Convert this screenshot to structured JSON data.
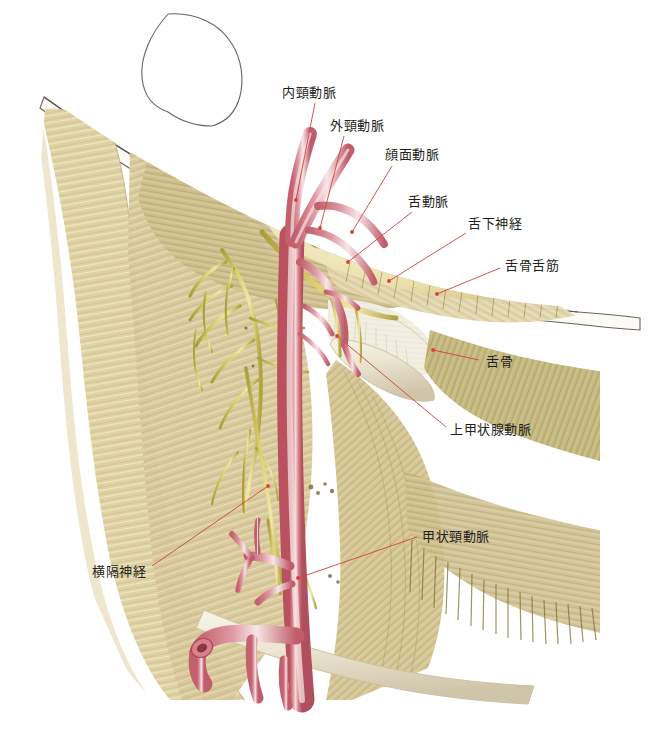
{
  "figure": {
    "background_color": "#ffffff",
    "width": 649,
    "height": 734,
    "leader_line_color": "#d4413c",
    "label_text_color": "#231f20"
  },
  "palette": {
    "artery": "#d9808c",
    "artery_shadow": "#b9515f",
    "artery_highlight": "#f6e0e0",
    "nerve": "#d8cc62",
    "nerve_shadow": "#a89a33",
    "muscle_light": "#ded0a2",
    "muscle_mid": "#c8b781",
    "muscle_dark": "#9a8b55",
    "muscle_olive": "#8d8347",
    "gland_fat": "#eee6b4",
    "fascia_white": "#f4f2e9",
    "bone": "#efeadb",
    "skin_outline": "#6b6257"
  },
  "labels": [
    {
      "id": "internal-carotid-artery",
      "text": "内頸動脈",
      "x": 282,
      "y": 93,
      "anchor": "start",
      "leader": [
        [
          315,
          103
        ],
        [
          296,
          200
        ]
      ]
    },
    {
      "id": "external-carotid-artery",
      "text": "外頸動脈",
      "x": 330,
      "y": 126,
      "anchor": "start",
      "leader": [
        [
          344,
          136
        ],
        [
          320,
          228
        ]
      ]
    },
    {
      "id": "facial-artery",
      "text": "顔面動脈",
      "x": 385,
      "y": 155,
      "anchor": "start",
      "leader": [
        [
          392,
          166
        ],
        [
          352,
          232
        ]
      ]
    },
    {
      "id": "lingual-artery",
      "text": "舌動脈",
      "x": 408,
      "y": 202,
      "anchor": "start",
      "leader": [
        [
          412,
          212
        ],
        [
          348,
          262
        ]
      ]
    },
    {
      "id": "hypoglossal-nerve",
      "text": "舌下神経",
      "x": 468,
      "y": 224,
      "anchor": "start",
      "leader": [
        [
          466,
          233
        ],
        [
          389,
          281
        ]
      ]
    },
    {
      "id": "hyoglossus-muscle",
      "text": "舌骨舌筋",
      "x": 505,
      "y": 266,
      "anchor": "start",
      "leader": [
        [
          500,
          268
        ],
        [
          437,
          294
        ]
      ]
    },
    {
      "id": "hyoid-bone",
      "text": "舌骨",
      "x": 486,
      "y": 362,
      "anchor": "start",
      "leader": [
        [
          479,
          360
        ],
        [
          433,
          350
        ]
      ]
    },
    {
      "id": "superior-thyroid-artery",
      "text": "上甲状腺動脈",
      "x": 450,
      "y": 430,
      "anchor": "start",
      "leader": [
        [
          446,
          427
        ],
        [
          337,
          336
        ]
      ]
    },
    {
      "id": "thyrocervical-trunk",
      "text": "甲状頸動脈",
      "x": 422,
      "y": 537,
      "anchor": "start",
      "leader": [
        [
          417,
          537
        ],
        [
          298,
          578
        ]
      ]
    },
    {
      "id": "phrenic-nerve",
      "text": "横隔神経",
      "x": 92,
      "y": 572,
      "anchor": "start",
      "leader": [
        [
          152,
          566
        ],
        [
          268,
          486
        ]
      ]
    }
  ]
}
